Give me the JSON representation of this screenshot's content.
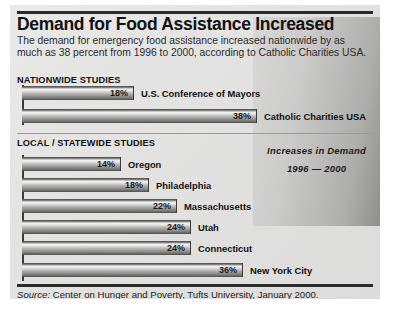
{
  "title": "Demand for Food Assistance Increased",
  "deck": "The demand for emergency food assistance increased nationwide by as much as 38 percent from 1996 to 2000, according to Catholic Charities USA.",
  "sections": {
    "nationwide_heading": "NATIONWIDE STUDIES",
    "local_heading": "LOCAL / STATEWIDE STUDIES"
  },
  "callout": {
    "line1": "Increases in Demand",
    "line2": "1996 — 2000"
  },
  "source": {
    "label": "Source:",
    "text": " Center on Hunger and Poverty, Tufts University, January 2000."
  },
  "chart_data": {
    "type": "bar",
    "title": "Demand for Food Assistance Increased",
    "subtitle": "Increases in Demand 1996 — 2000",
    "xlabel": "",
    "ylabel": "",
    "xlim": [
      0,
      38
    ],
    "grid": false,
    "legend": false,
    "orientation": "horizontal",
    "value_suffix": "%",
    "groups": [
      {
        "name": "NATIONWIDE STUDIES",
        "categories": [
          "U.S. Conference of Mayors",
          "Catholic Charities USA"
        ],
        "values": [
          18,
          38
        ],
        "value_labels": [
          "18%",
          "38%"
        ]
      },
      {
        "name": "LOCAL / STATEWIDE STUDIES",
        "categories": [
          "Oregon",
          "Philadelphia",
          "Massachusetts",
          "Utah",
          "Connecticut",
          "New York City"
        ],
        "values": [
          14,
          18,
          22,
          24,
          24,
          36
        ],
        "value_labels": [
          "14%",
          "18%",
          "22%",
          "24%",
          "24%",
          "36%"
        ]
      }
    ],
    "source": "Source: Center on Hunger and Poverty, Tufts University, January 2000."
  },
  "bars": [
    {
      "label": "U.S. Conference of Mayors",
      "value_label": "18%",
      "top": 81,
      "width": 112
    },
    {
      "label": "Catholic Charities USA",
      "value_label": "38%",
      "top": 104,
      "width": 235
    },
    {
      "label": "Oregon",
      "value_label": "14%",
      "top": 152,
      "width": 99
    },
    {
      "label": "Philadelphia",
      "value_label": "18%",
      "top": 173,
      "width": 127
    },
    {
      "label": "Massachusetts",
      "value_label": "22%",
      "top": 194,
      "width": 155
    },
    {
      "label": "Utah",
      "value_label": "24%",
      "top": 215,
      "width": 169
    },
    {
      "label": "Connecticut",
      "value_label": "24%",
      "top": 236,
      "width": 169
    },
    {
      "label": "New York City",
      "value_label": "36%",
      "top": 258,
      "width": 221
    }
  ]
}
